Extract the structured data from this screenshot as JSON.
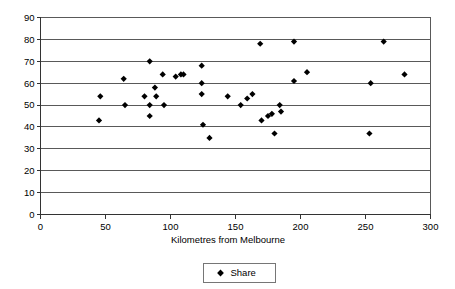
{
  "chart_data": {
    "type": "scatter",
    "title": "",
    "xlabel": "Kilometres from Melbourne",
    "ylabel": "",
    "xlim": [
      0,
      300
    ],
    "ylim": [
      0,
      90
    ],
    "xticks": [
      0,
      50,
      100,
      150,
      200,
      250,
      300
    ],
    "yticks": [
      0,
      10,
      20,
      30,
      40,
      50,
      60,
      70,
      80,
      90
    ],
    "xtick_labels": [
      "0",
      "50",
      "100",
      "150",
      "200",
      "250",
      "300"
    ],
    "ytick_labels": [
      "0",
      "10",
      "20",
      "30",
      "40",
      "50",
      "60",
      "70",
      "80",
      "90"
    ],
    "grid": "horizontal",
    "legend_position": "bottom",
    "marker": "diamond",
    "marker_color": "#000000",
    "series": [
      {
        "name": "Share",
        "points": [
          [
            45,
            43
          ],
          [
            46,
            54
          ],
          [
            64,
            62
          ],
          [
            65,
            50
          ],
          [
            80,
            54
          ],
          [
            84,
            70
          ],
          [
            84,
            50
          ],
          [
            84,
            45
          ],
          [
            88,
            58
          ],
          [
            89,
            54
          ],
          [
            94,
            64
          ],
          [
            95,
            50
          ],
          [
            104,
            63
          ],
          [
            108,
            64
          ],
          [
            110,
            64
          ],
          [
            124,
            68
          ],
          [
            124,
            60
          ],
          [
            124,
            55
          ],
          [
            125,
            41
          ],
          [
            130,
            35
          ],
          [
            144,
            54
          ],
          [
            154,
            50
          ],
          [
            159,
            53
          ],
          [
            163,
            55
          ],
          [
            169,
            78
          ],
          [
            170,
            43
          ],
          [
            175,
            45
          ],
          [
            178,
            46
          ],
          [
            180,
            37
          ],
          [
            184,
            50
          ],
          [
            185,
            47
          ],
          [
            195,
            79
          ],
          [
            195,
            61
          ],
          [
            205,
            65
          ],
          [
            253,
            37
          ],
          [
            254,
            60
          ],
          [
            264,
            79
          ],
          [
            280,
            64
          ]
        ]
      }
    ]
  },
  "legend": {
    "entries": [
      {
        "label": "Share",
        "marker": "diamond",
        "color": "#000000"
      }
    ]
  },
  "axes": {
    "x_title": "Kilometres from Melbourne"
  }
}
